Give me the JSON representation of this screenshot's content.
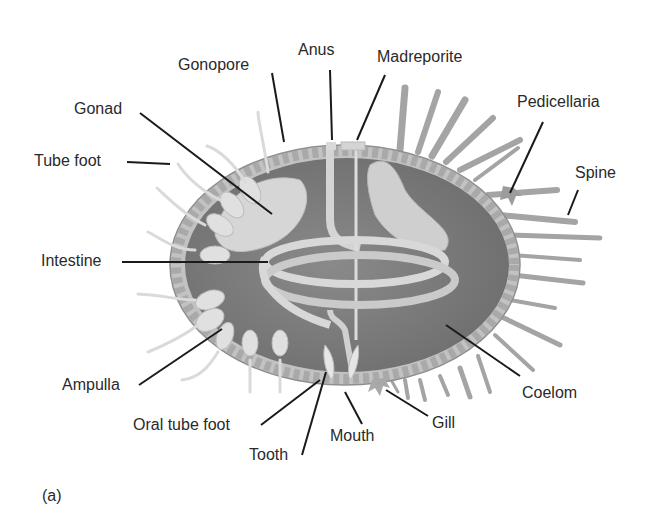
{
  "figure": {
    "panel_label": "(a)",
    "labels": [
      {
        "id": "anus",
        "text": "Anus"
      },
      {
        "id": "madreporite",
        "text": "Madreporite"
      },
      {
        "id": "gonopore",
        "text": "Gonopore"
      },
      {
        "id": "gonad",
        "text": "Gonad"
      },
      {
        "id": "pedicellaria",
        "text": "Pedicellaria"
      },
      {
        "id": "tube_foot",
        "text": "Tube foot"
      },
      {
        "id": "spine",
        "text": "Spine"
      },
      {
        "id": "intestine",
        "text": "Intestine"
      },
      {
        "id": "ampulla",
        "text": "Ampulla"
      },
      {
        "id": "coelom",
        "text": "Coelom"
      },
      {
        "id": "oral_tube_foot",
        "text": "Oral tube foot"
      },
      {
        "id": "gill",
        "text": "Gill"
      },
      {
        "id": "tooth",
        "text": "Tooth"
      },
      {
        "id": "mouth",
        "text": "Mouth"
      }
    ]
  },
  "colors": {
    "background": "#ffffff",
    "coelom_fill": "#7d7d7d",
    "test_wall": "#b9b9b9",
    "organ_light": "#d9d9d9",
    "spine": "#a8a8a8",
    "leader_line": "#1a1a1a",
    "text": "#2a2a2a"
  }
}
